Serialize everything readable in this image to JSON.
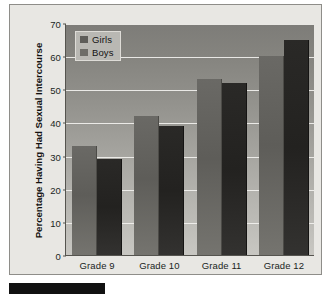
{
  "chart_data": {
    "type": "bar",
    "title": "",
    "xlabel": "",
    "ylabel": "Percentage Having Had Sexual Intercourse",
    "categories": [
      "Grade 9",
      "Grade 10",
      "Grade 11",
      "Grade 12"
    ],
    "series": [
      {
        "name": "Girls",
        "values": [
          33,
          42,
          53,
          60
        ]
      },
      {
        "name": "Boys",
        "values": [
          29,
          39,
          52,
          65
        ]
      }
    ],
    "ylim": [
      0,
      70
    ],
    "yticks": [
      0,
      10,
      20,
      30,
      40,
      50,
      60,
      70
    ],
    "ytick_labels": [
      "0",
      "10",
      "20",
      "30",
      "40",
      "50",
      "60",
      "70"
    ],
    "grid": true,
    "legend_position": "top-left",
    "colors": {
      "girls": "#5e5d59",
      "boys": "#232220",
      "gridline": "#f2f1ee",
      "axis": "#55544f",
      "figure_background": "#e8e7e3"
    }
  },
  "legend": {
    "entries": [
      {
        "label": "Girls",
        "swatch": "girls-swatch"
      },
      {
        "label": "Boys",
        "swatch": "boys-swatch"
      }
    ]
  }
}
